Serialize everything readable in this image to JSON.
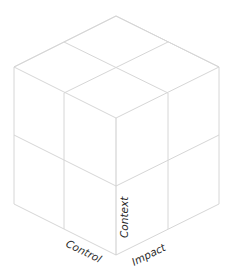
{
  "diagram": {
    "type": "isometric-cube-2x2x2",
    "line_color": "#d6d6d6",
    "label_color": "#2a2a2a",
    "axes": {
      "left": "Control",
      "right": "Impact",
      "vertical": "Context"
    }
  }
}
